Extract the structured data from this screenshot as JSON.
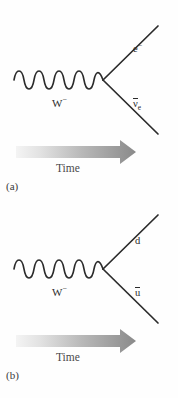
{
  "figure": {
    "background_color": "#fefefe",
    "line_color": "#2b2b2b",
    "arrow_gradient_start": "#f2f2f2",
    "arrow_gradient_end": "#8a8a8a",
    "width": 178,
    "height": 398
  },
  "panels": [
    {
      "id": "a",
      "caption": "(a)",
      "boson_label_base": "W",
      "boson_label_charge": "−",
      "time_label": "Time",
      "outgoing_upper": {
        "name": "electron",
        "base": "e",
        "charge": "−",
        "subscript": "",
        "overbar": false
      },
      "outgoing_lower": {
        "name": "electron-antineutrino",
        "base": "ν",
        "charge": "",
        "subscript": "e",
        "overbar": true
      }
    },
    {
      "id": "b",
      "caption": "(b)",
      "boson_label_base": "W",
      "boson_label_charge": "−",
      "time_label": "Time",
      "outgoing_upper": {
        "name": "down-quark",
        "base": "d",
        "charge": "",
        "subscript": "",
        "overbar": false
      },
      "outgoing_lower": {
        "name": "anti-up-quark",
        "base": "u",
        "charge": "",
        "subscript": "",
        "overbar": true
      }
    }
  ]
}
